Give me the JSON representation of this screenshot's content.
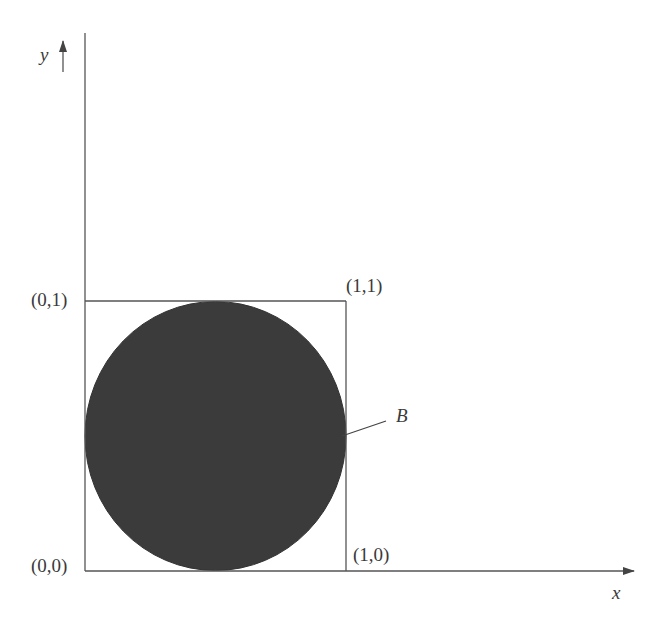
{
  "diagram": {
    "axes": {
      "x_label": "x",
      "y_label": "y"
    },
    "points": {
      "origin": "(0,0)",
      "top_left": "(0,1)",
      "top_right": "(1,1)",
      "bottom_right": "(1,0)"
    },
    "region": {
      "label": "B",
      "shape": "disk inscribed in unit square",
      "fill_color": "#3b3b3b"
    },
    "colors": {
      "line": "#555555",
      "text": "#3a3a3a",
      "background": "#ffffff"
    }
  }
}
